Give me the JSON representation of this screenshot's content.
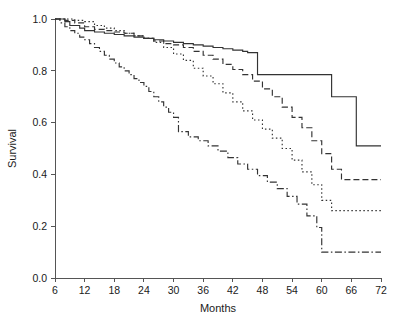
{
  "chart_data": {
    "type": "line",
    "title": "",
    "subtitle": "",
    "xlabel": "Months",
    "ylabel": "Survival",
    "xlim": [
      6,
      72
    ],
    "ylim": [
      0.0,
      1.0
    ],
    "grid": false,
    "legend_position": "none",
    "xticks": [
      6,
      12,
      18,
      24,
      30,
      36,
      42,
      48,
      54,
      60,
      66,
      72
    ],
    "xtick_labels": [
      "6",
      "12",
      "18",
      "24",
      "30",
      "36",
      "42",
      "48",
      "54",
      "60",
      "66",
      "72"
    ],
    "yticks": [
      0.0,
      0.2,
      0.4,
      0.6,
      0.8,
      1.0
    ],
    "ytick_labels": [
      "0.0",
      "0.2",
      "0.4",
      "0.6",
      "0.8",
      "1.0"
    ],
    "interpolation": "step-after",
    "line_color": "#333333",
    "series": [
      {
        "name": "curve-solid",
        "style": "solid",
        "dasharray": "none",
        "final_value": 0.51,
        "x": [
          6,
          8,
          9,
          11,
          12,
          14,
          16,
          18,
          20,
          22,
          24,
          26,
          28,
          30,
          32,
          34,
          36,
          38,
          40,
          42,
          44,
          45,
          47,
          49,
          51,
          53,
          55,
          57,
          59,
          60,
          62,
          64,
          66,
          67,
          72
        ],
        "values": [
          1.0,
          0.99,
          0.975,
          0.965,
          0.955,
          0.95,
          0.945,
          0.94,
          0.935,
          0.93,
          0.925,
          0.92,
          0.915,
          0.91,
          0.905,
          0.9,
          0.895,
          0.89,
          0.885,
          0.88,
          0.875,
          0.87,
          0.785,
          0.785,
          0.785,
          0.785,
          0.785,
          0.785,
          0.785,
          0.785,
          0.7,
          0.7,
          0.7,
          0.51,
          0.51
        ]
      },
      {
        "name": "curve-dashed",
        "style": "dashed",
        "dasharray": "6,3",
        "final_value": 0.38,
        "x": [
          6,
          8,
          10,
          12,
          14,
          16,
          18,
          20,
          22,
          24,
          26,
          28,
          30,
          32,
          34,
          36,
          38,
          40,
          42,
          44,
          46,
          48,
          50,
          52,
          54,
          56,
          58,
          60,
          62,
          64,
          66,
          72
        ],
        "values": [
          1.0,
          0.995,
          0.985,
          0.97,
          0.96,
          0.955,
          0.95,
          0.945,
          0.935,
          0.925,
          0.915,
          0.905,
          0.9,
          0.89,
          0.875,
          0.86,
          0.845,
          0.825,
          0.805,
          0.785,
          0.76,
          0.73,
          0.7,
          0.66,
          0.62,
          0.58,
          0.53,
          0.48,
          0.42,
          0.38,
          0.38,
          0.38
        ]
      },
      {
        "name": "curve-dotted",
        "style": "dotted",
        "dasharray": "1.5,2.5",
        "final_value": 0.26,
        "x": [
          6,
          8,
          10,
          12,
          14,
          16,
          18,
          20,
          22,
          24,
          26,
          28,
          30,
          32,
          34,
          36,
          38,
          40,
          42,
          44,
          46,
          48,
          50,
          52,
          54,
          56,
          58,
          60,
          62,
          72
        ],
        "values": [
          1.0,
          1.0,
          0.995,
          0.99,
          0.975,
          0.965,
          0.955,
          0.945,
          0.935,
          0.925,
          0.91,
          0.89,
          0.865,
          0.84,
          0.81,
          0.78,
          0.75,
          0.715,
          0.68,
          0.645,
          0.61,
          0.575,
          0.54,
          0.5,
          0.455,
          0.41,
          0.36,
          0.3,
          0.26,
          0.26
        ]
      },
      {
        "name": "curve-dash-dot",
        "style": "dash-dot",
        "dasharray": "7,2.5,1.5,2.5",
        "final_value": 0.1,
        "x": [
          6,
          7,
          8,
          9,
          10,
          11,
          12,
          13,
          14,
          15,
          16,
          17,
          18,
          19,
          20,
          21,
          22,
          23,
          24,
          25,
          26,
          27,
          28,
          29,
          30,
          31,
          33,
          35,
          37,
          39,
          41,
          43,
          45,
          47,
          49,
          51,
          53,
          55,
          57,
          59,
          60,
          72
        ],
        "values": [
          1.0,
          0.985,
          0.97,
          0.955,
          0.945,
          0.93,
          0.92,
          0.905,
          0.89,
          0.875,
          0.86,
          0.845,
          0.83,
          0.815,
          0.8,
          0.785,
          0.77,
          0.755,
          0.74,
          0.72,
          0.7,
          0.68,
          0.66,
          0.64,
          0.62,
          0.565,
          0.545,
          0.53,
          0.51,
          0.49,
          0.465,
          0.44,
          0.42,
          0.395,
          0.37,
          0.345,
          0.315,
          0.285,
          0.24,
          0.195,
          0.1,
          0.1
        ]
      }
    ]
  }
}
